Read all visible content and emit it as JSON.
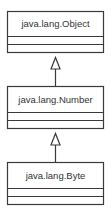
{
  "diagram": {
    "type": "uml-class-hierarchy",
    "classes": [
      {
        "name": "java.lang.Object",
        "attributes": [],
        "methods": []
      },
      {
        "name": "java.lang.Number",
        "attributes": [],
        "methods": []
      },
      {
        "name": "java.lang.Byte",
        "attributes": [],
        "methods": []
      }
    ],
    "relations": [
      {
        "from": "java.lang.Number",
        "to": "java.lang.Object",
        "kind": "generalization"
      },
      {
        "from": "java.lang.Byte",
        "to": "java.lang.Number",
        "kind": "generalization"
      }
    ],
    "colors": {
      "stroke": "#3a3a3a",
      "text": "#333333",
      "background": "#ffffff"
    }
  }
}
